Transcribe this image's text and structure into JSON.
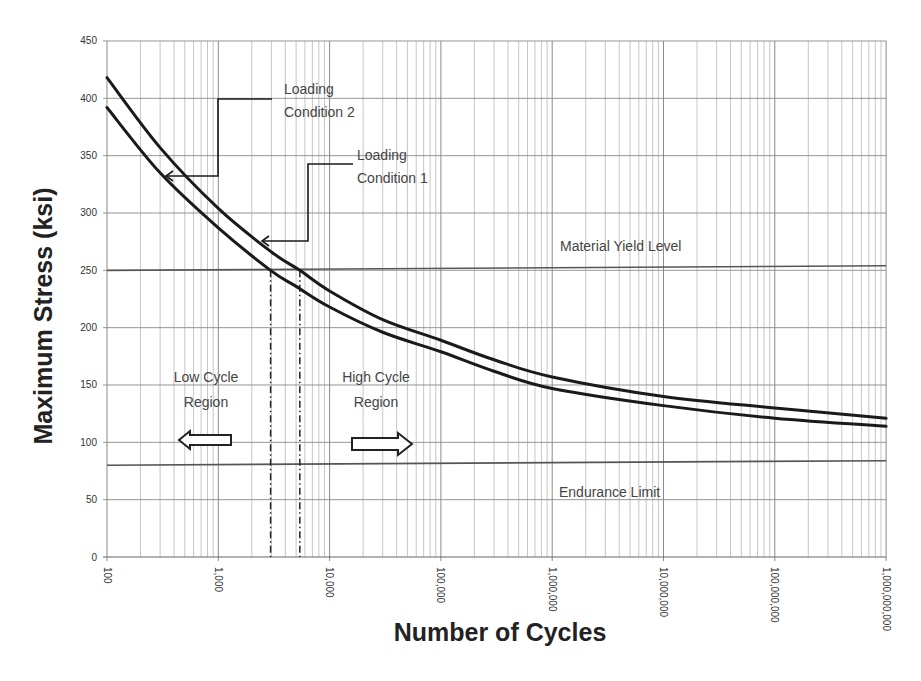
{
  "chart_data": {
    "type": "line",
    "title": "",
    "xlabel": "Number of Cycles",
    "ylabel": "Maximum Stress (ksi)",
    "xscale": "log",
    "xlim": [
      100,
      1000000000
    ],
    "ylim": [
      0,
      450
    ],
    "grid": true,
    "x_tick_labels": [
      "100",
      "1,000",
      "10,000",
      "100,000",
      "1,000,000",
      "10,000,000",
      "100,000,000",
      "1,000,000,000"
    ],
    "x_tick_values": [
      100,
      1000,
      10000,
      100000,
      1000000,
      10000000,
      100000000,
      1000000000
    ],
    "y_tick_labels": [
      "0",
      "50",
      "100",
      "150",
      "200",
      "250",
      "300",
      "350",
      "400",
      "450"
    ],
    "y_tick_values": [
      0,
      50,
      100,
      150,
      200,
      250,
      300,
      350,
      400,
      450
    ],
    "series": [
      {
        "name": "Loading Condition 1",
        "x": [
          100,
          300,
          1000,
          3000,
          5400,
          10000,
          30000,
          100000,
          300000,
          1000000,
          10000000,
          100000000,
          1000000000
        ],
        "values": [
          418,
          357,
          304,
          266,
          250,
          232,
          207,
          189,
          172,
          157,
          140,
          130,
          121
        ]
      },
      {
        "name": "Loading Condition 2",
        "x": [
          100,
          300,
          1000,
          2950,
          5000,
          10000,
          30000,
          100000,
          300000,
          1000000,
          10000000,
          100000000,
          1000000000
        ],
        "values": [
          392,
          335,
          287,
          250,
          236,
          218,
          196,
          179,
          162,
          147,
          132,
          121,
          114
        ]
      }
    ],
    "reference_lines": [
      {
        "name": "Material Yield Level",
        "y": 250,
        "y_end": 254
      },
      {
        "name": "Endurance Limit",
        "y": 80,
        "y_end": 84
      }
    ],
    "vertical_markers": [
      {
        "x": 2950,
        "style": "dash-dot",
        "label": ""
      },
      {
        "x": 5400,
        "style": "dash-dot",
        "label": ""
      }
    ],
    "annotations": [
      {
        "text_lines": [
          "Loading",
          "Condition 2"
        ],
        "points_to": "Loading Condition 2"
      },
      {
        "text_lines": [
          "Loading",
          "Condition 1"
        ],
        "points_to": "Loading Condition 1"
      },
      {
        "text_lines": [
          "Material Yield Level"
        ]
      },
      {
        "text_lines": [
          "Endurance Limit"
        ]
      },
      {
        "text_lines": [
          "Low Cycle",
          "Region"
        ],
        "arrow": "left"
      },
      {
        "text_lines": [
          "High Cycle",
          "Region"
        ],
        "arrow": "right"
      }
    ]
  },
  "labels": {
    "xlabel": "Number of Cycles",
    "ylabel": "Maximum Stress (ksi)",
    "lc2_line1": "Loading",
    "lc2_line2": "Condition 2",
    "lc1_line1": "Loading",
    "lc1_line2": "Condition 1",
    "yield": "Material Yield Level",
    "endurance": "Endurance Limit",
    "low_line1": "Low Cycle",
    "low_line2": "Region",
    "high_line1": "High Cycle",
    "high_line2": "Region"
  },
  "colors": {
    "curve": "#1a1a1a",
    "grid": "#b8b8b8",
    "major_grid": "#8a8a8a",
    "ref_line": "#555555"
  }
}
